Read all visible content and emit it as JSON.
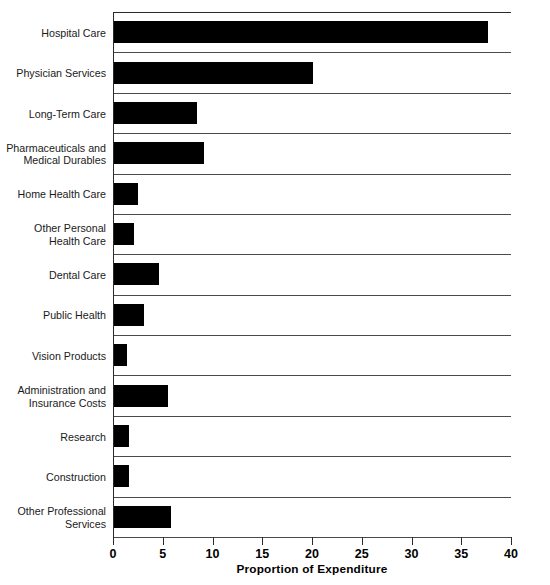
{
  "chart_data": {
    "type": "bar",
    "orientation": "horizontal",
    "title": "",
    "xlabel": "Proportion of Expenditure",
    "ylabel": "",
    "xlim": [
      0,
      40
    ],
    "xticks": [
      0,
      5,
      10,
      15,
      20,
      25,
      30,
      35,
      40
    ],
    "xtick_labels": [
      "0",
      "5",
      "10",
      "15",
      "20",
      "25",
      "30",
      "35",
      "40"
    ],
    "grid": "horizontal-band-separators",
    "legend": "none",
    "bar_color": "#000000",
    "categories": [
      "Hospital Care",
      "Physician Services",
      "Long-Term Care",
      "Pharmaceuticals and\nMedical Durables",
      "Home Health Care",
      "Other Personal\nHealth Care",
      "Dental Care",
      "Public Health",
      "Vision Products",
      "Administration and\nInsurance Costs",
      "Research",
      "Construction",
      "Other Professional\nServices"
    ],
    "values": [
      37.6,
      20.0,
      8.3,
      9.0,
      2.4,
      2.0,
      4.5,
      3.0,
      1.3,
      5.4,
      1.5,
      1.5,
      5.7
    ]
  }
}
